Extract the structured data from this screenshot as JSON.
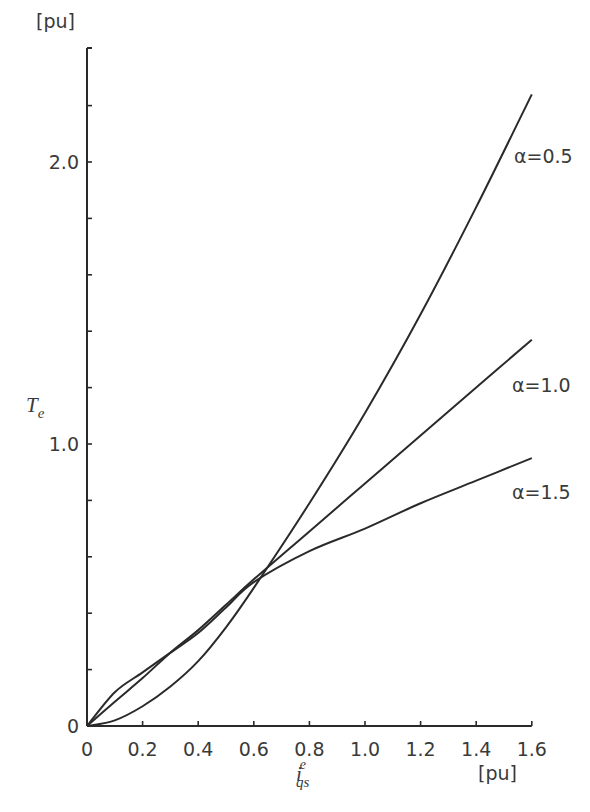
{
  "chart_data": {
    "type": "line",
    "title": "",
    "xlabel": "i_qs^e",
    "xlabel_main": "i",
    "xlabel_sub": "qs",
    "xlabel_sup": "e",
    "x_unit": "[pu]",
    "ylabel": "T_e",
    "ylabel_main": "T",
    "ylabel_sub": "e",
    "y_unit": "[pu]",
    "xlim": [
      0,
      1.6
    ],
    "ylim": [
      0,
      2.3
    ],
    "x_ticks": [
      0,
      0.2,
      0.4,
      0.6,
      0.8,
      1.0,
      1.2,
      1.4,
      1.6
    ],
    "x_tick_labels": [
      "0",
      "0.2",
      "0.4",
      "0.6",
      "0.8",
      "1.0",
      "1.2",
      "1.4",
      "1.6"
    ],
    "y_ticks": [
      0,
      0.2,
      0.4,
      0.6,
      0.8,
      1.0,
      1.2,
      1.4,
      1.6,
      1.8,
      2.0,
      2.2
    ],
    "y_tick_labels": [
      {
        "value": 0,
        "label": "0"
      },
      {
        "value": 1.0,
        "label": "1.0"
      },
      {
        "value": 2.0,
        "label": "2.0"
      }
    ],
    "grid": false,
    "legend": "inline labels at line ends",
    "x": [
      0,
      0.1,
      0.2,
      0.3,
      0.4,
      0.5,
      0.6,
      0.8,
      1.0,
      1.2,
      1.4,
      1.6
    ],
    "series": [
      {
        "name": "α=0.5",
        "values": [
          0,
          0.02,
          0.07,
          0.14,
          0.23,
          0.35,
          0.49,
          0.79,
          1.11,
          1.46,
          1.84,
          2.24
        ]
      },
      {
        "name": "α=1.0",
        "values": [
          0,
          0.086,
          0.17,
          0.26,
          0.34,
          0.43,
          0.52,
          0.69,
          0.86,
          1.03,
          1.2,
          1.37
        ]
      },
      {
        "name": "α=1.5",
        "values": [
          0,
          0.12,
          0.19,
          0.26,
          0.33,
          0.42,
          0.51,
          0.62,
          0.7,
          0.79,
          0.87,
          0.95
        ]
      }
    ]
  },
  "layout": {
    "origin_px": [
      87,
      726
    ],
    "x_px_per_unit": 278,
    "y_px_per_unit": 282,
    "y_axis_top_px": 48,
    "line_color": "#2a2a2a"
  }
}
